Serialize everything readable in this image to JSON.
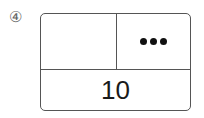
{
  "problem": {
    "number_label": "④",
    "top_left": "",
    "top_right_dots": 3,
    "top_right_icon": "three-dots",
    "bottom_total": "10"
  }
}
